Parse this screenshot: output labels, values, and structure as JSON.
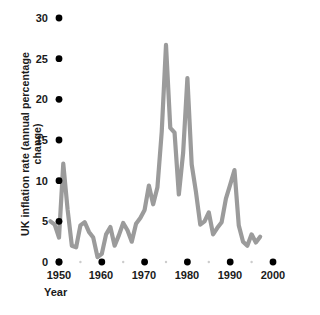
{
  "chart_data": {
    "type": "line",
    "title": "",
    "subtitle": "",
    "xlabel": "Year",
    "ylabel": "UK inflation rate (annual percentage change)",
    "xlim": [
      1948,
      2001
    ],
    "ylim": [
      0,
      30
    ],
    "xticks": [
      1950,
      1960,
      1970,
      1980,
      1990,
      2000
    ],
    "xtick_labels": [
      "1950",
      "1960",
      "1970",
      "1980",
      "1990",
      "2000"
    ],
    "yticks": [
      0,
      5,
      10,
      15,
      20,
      25,
      30
    ],
    "ytick_labels": [
      "0",
      "5",
      "10",
      "15",
      "20",
      "25",
      "30"
    ],
    "minor_xticks": [
      1955,
      1965,
      1975,
      1985,
      1995
    ],
    "grid": false,
    "legend": null,
    "line_color": "#9b9b9b",
    "tick_color": "#000000",
    "background": "#ffffff",
    "series": [
      {
        "name": "UK inflation rate",
        "x": [
          1948,
          1949,
          1950,
          1951,
          1952,
          1953,
          1954,
          1955,
          1956,
          1957,
          1958,
          1959,
          1960,
          1961,
          1962,
          1963,
          1964,
          1965,
          1966,
          1967,
          1968,
          1969,
          1970,
          1971,
          1972,
          1973,
          1974,
          1975,
          1976,
          1977,
          1978,
          1979,
          1980,
          1981,
          1982,
          1983,
          1984,
          1985,
          1986,
          1987,
          1988,
          1989,
          1990,
          1991,
          1992,
          1993,
          1994,
          1995,
          1996,
          1997
        ],
        "y": [
          5.0,
          4.6,
          3.0,
          12.1,
          6.5,
          2.0,
          1.8,
          4.5,
          4.9,
          3.7,
          3.0,
          0.6,
          1.0,
          3.4,
          4.3,
          2.0,
          3.3,
          4.8,
          3.9,
          2.5,
          4.7,
          5.4,
          6.4,
          9.4,
          7.1,
          9.2,
          16.0,
          26.7,
          16.5,
          15.9,
          8.3,
          13.4,
          22.6,
          12.0,
          8.6,
          4.6,
          5.0,
          6.1,
          3.4,
          4.2,
          4.9,
          7.8,
          9.5,
          11.3,
          4.5,
          2.5,
          2.0,
          3.4,
          2.4,
          3.1
        ]
      }
    ],
    "annotations": []
  }
}
